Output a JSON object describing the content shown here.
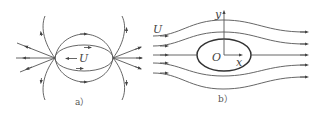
{
  "panel_a": {
    "caption": "a）",
    "velocity_label": "U",
    "description": "Streamlines of a body moving left with velocity U (relative flow around moving ellipse)"
  },
  "panel_b": {
    "caption": "b）",
    "velocity_label": "U",
    "origin_label": "O",
    "x_axis_label": "x",
    "y_axis_label": "y",
    "description": "Uniform flow U past a stationary ellipse"
  },
  "colors": {
    "line": "#555555",
    "body": "#333333",
    "background": "#ffffff"
  }
}
